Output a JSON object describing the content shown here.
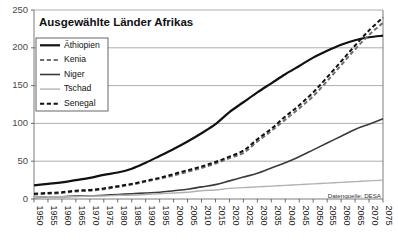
{
  "chart_data": {
    "type": "line",
    "title": "Ausgewählte Länder Afrikas",
    "xlabel": "",
    "ylabel": "",
    "source_note": "Datenquelle: DESA",
    "grid": "horizontal",
    "legend_position": "top-left",
    "xlim": [
      1950,
      2075
    ],
    "ylim": [
      0,
      250
    ],
    "yticks": [
      0,
      50,
      100,
      150,
      200,
      250
    ],
    "ytick_labels": [
      "0",
      "50",
      "100",
      "150",
      "200",
      "250"
    ],
    "x": [
      1950,
      1955,
      1960,
      1965,
      1970,
      1975,
      1980,
      1985,
      1990,
      1995,
      2000,
      2005,
      2010,
      2015,
      2020,
      2025,
      2030,
      2035,
      2040,
      2045,
      2050,
      2055,
      2060,
      2065,
      2070,
      2075
    ],
    "xtick_labels": [
      "1950",
      "1955",
      "1960",
      "1965",
      "1970",
      "1975",
      "1980",
      "1985",
      "1990",
      "1995",
      "2000",
      "2005",
      "2010",
      "2015",
      "2020",
      "2025",
      "2030",
      "2035",
      "2040",
      "2045",
      "2050",
      "2055",
      "2060",
      "2065",
      "2070",
      "2075"
    ],
    "series": [
      {
        "name": "Äthiopien",
        "style": "solid",
        "color": "#111111",
        "width": 2.2,
        "values": [
          18,
          20,
          22,
          25,
          28,
          32,
          35,
          40,
          48,
          57,
          66,
          76,
          87,
          99,
          115,
          128,
          141,
          153,
          165,
          176,
          187,
          196,
          204,
          210,
          214,
          216
        ]
      },
      {
        "name": "Kenia",
        "style": "dashed",
        "color": "#6f6f6f",
        "width": 2.0,
        "values": [
          6,
          7,
          8,
          10,
          11,
          13,
          16,
          19,
          23,
          27,
          31,
          36,
          41,
          47,
          54,
          61,
          76,
          90,
          105,
          120,
          136,
          156,
          177,
          198,
          217,
          233
        ]
      },
      {
        "name": "Niger",
        "style": "solid",
        "color": "#3a3a3a",
        "width": 1.6,
        "values": [
          2,
          3,
          3,
          4,
          4,
          5,
          6,
          7,
          8,
          9,
          11,
          13,
          16,
          19,
          24,
          29,
          34,
          41,
          48,
          56,
          65,
          74,
          83,
          92,
          99,
          106
        ]
      },
      {
        "name": "Tschad",
        "style": "solid",
        "color": "#b2b2b2",
        "width": 1.4,
        "values": [
          2,
          3,
          3,
          3,
          4,
          4,
          5,
          5,
          6,
          7,
          8,
          9,
          11,
          12,
          14,
          15,
          16,
          17,
          18,
          19,
          20,
          21,
          22,
          23,
          24,
          25
        ]
      },
      {
        "name": "Senegal",
        "style": "dashed",
        "color": "#111111",
        "width": 2.0,
        "values": [
          7,
          8,
          9,
          11,
          12,
          14,
          17,
          20,
          24,
          28,
          33,
          38,
          43,
          49,
          56,
          64,
          79,
          93,
          109,
          124,
          141,
          161,
          182,
          203,
          223,
          240
        ]
      }
    ]
  }
}
